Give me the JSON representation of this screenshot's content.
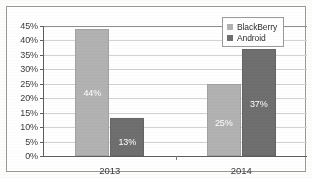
{
  "chart_data": {
    "type": "bar",
    "title": "",
    "subtitle": "",
    "xlabel": "",
    "ylabel": "",
    "categories": [
      "2013",
      "2014"
    ],
    "series": [
      {
        "name": "BlackBerry",
        "color": "#b2b2b2",
        "values": [
          44,
          25
        ]
      },
      {
        "name": "Android",
        "color": "#6f6f6f",
        "values": [
          13,
          37
        ]
      }
    ],
    "bar_labels": [
      [
        "44%",
        "13%"
      ],
      [
        "25%",
        "37%"
      ]
    ],
    "ylim": [
      0,
      45
    ],
    "ytick_values": [
      0,
      5,
      10,
      15,
      20,
      25,
      30,
      35,
      40,
      45
    ],
    "ytick_labels": [
      "0%",
      "5%",
      "10%",
      "15%",
      "20%",
      "25%",
      "30%",
      "35%",
      "40%",
      "45%"
    ],
    "grid": true,
    "legend_position": "top-right",
    "value_labels_inside_bars": true,
    "note": "2013 group: BlackBerry 44%, Android 25%. 2014 group: BlackBerry 13%, Android 37%."
  },
  "legend": {
    "entries": [
      {
        "label": "BlackBerry"
      },
      {
        "label": "Android"
      }
    ]
  },
  "colors": {
    "blackberry": "#b2b2b2",
    "android": "#6f6f6f",
    "axis": "#5d5d5d",
    "grid": "#d2d2d2",
    "border": "#9a9a9a",
    "label_text": "#3b3b3b",
    "bar_label_text": "#ffffff",
    "background": "#ffffff"
  }
}
